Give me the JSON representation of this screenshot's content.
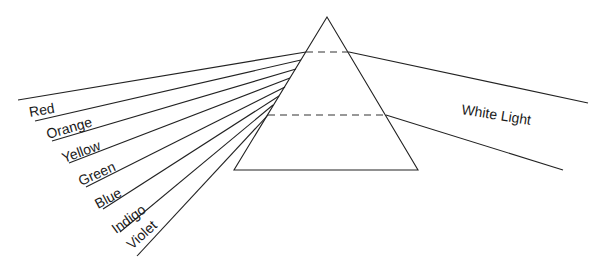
{
  "diagram": {
    "prism": {
      "apex": [
        327,
        17
      ],
      "base_left": [
        234,
        170
      ],
      "base_right": [
        418,
        170
      ]
    },
    "incoming_label": "White Light",
    "spectrum_labels": [
      "Red",
      "Orange",
      "Yellow",
      "Green",
      "Blue",
      "Indigo",
      "Violet"
    ],
    "colors": {
      "line": "#222222",
      "text": "#1a1a1a",
      "background": "#ffffff"
    }
  }
}
